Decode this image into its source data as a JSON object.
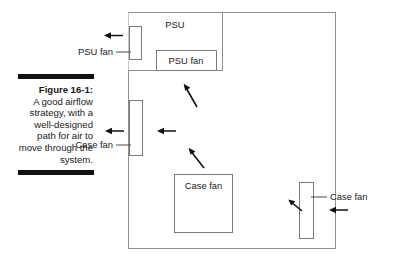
{
  "figure": {
    "caption_title": "Figure 16-1:",
    "caption_body": "A good airflow strategy, with a well-designed path for air to move through the system.",
    "rule_color": "#111111"
  },
  "diagram": {
    "case_label": "computer-case-outline",
    "boxes": [
      {
        "id": "psu",
        "label": "PSU"
      },
      {
        "id": "psu-fan-inner",
        "label": "PSU fan"
      },
      {
        "id": "psu-fan-wall",
        "label": ""
      },
      {
        "id": "case-fan-left",
        "label": ""
      },
      {
        "id": "case-fan-center",
        "label": "Case fan"
      },
      {
        "id": "case-fan-right",
        "label": ""
      }
    ],
    "labels": [
      {
        "id": "psu-fan-left-label",
        "text": "PSU fan"
      },
      {
        "id": "case-fan-left-label",
        "text": "Case fan"
      },
      {
        "id": "case-fan-right-label",
        "text": "Case fan"
      }
    ],
    "arrows": [
      {
        "id": "psu-fan-exhaust-arrow",
        "direction": "left"
      },
      {
        "id": "psu-intake-diagonal-arrow",
        "direction": "up-left"
      },
      {
        "id": "case-fan-left-exhaust-arrow",
        "direction": "left"
      },
      {
        "id": "case-fan-left-inner-arrow",
        "direction": "left"
      },
      {
        "id": "center-airflow-diagonal-arrow",
        "direction": "up-left"
      },
      {
        "id": "rear-airflow-diagonal-arrow",
        "direction": "up-left"
      },
      {
        "id": "case-fan-right-intake-arrow",
        "direction": "left"
      }
    ],
    "colors": {
      "outline": "#8e8e8e",
      "box": "#7a7a7a",
      "arrow": "#111111",
      "text": "#1a1a1a",
      "background": "#ffffff"
    }
  }
}
